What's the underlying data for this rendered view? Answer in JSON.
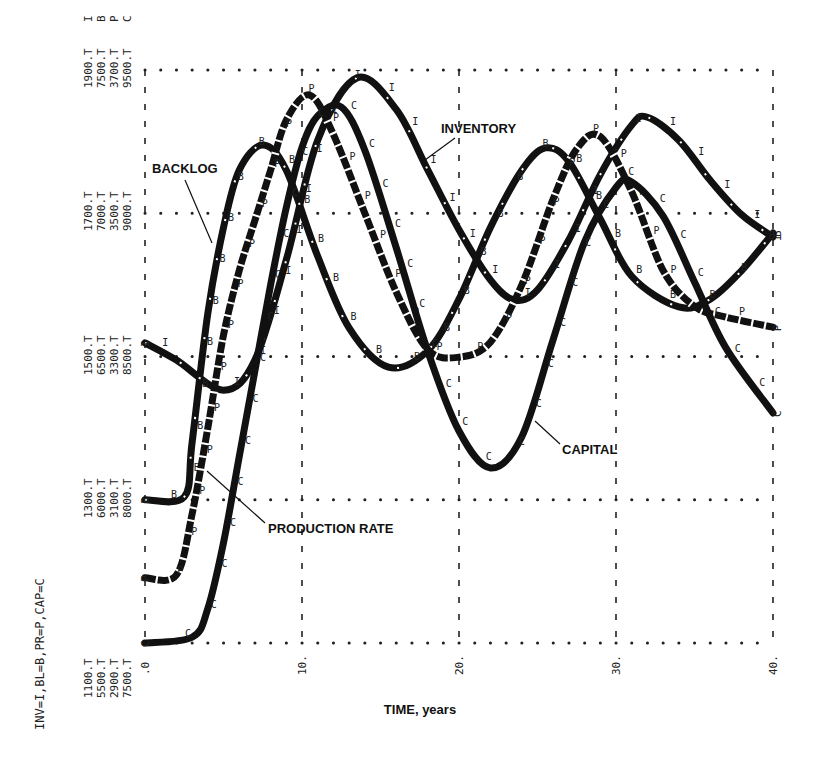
{
  "chart_data": {
    "type": "line",
    "title": "",
    "xlabel": "TIME, years",
    "ylabel": "INV=I,BL=B,PR=P,CAP=C",
    "xlim": [
      0,
      40
    ],
    "x_ticks": [
      ".0",
      "10.",
      "20.",
      "30.",
      "40."
    ],
    "x_tick_values": [
      0,
      10,
      20,
      30,
      40
    ],
    "grid": true,
    "legend_position": "inline annotations",
    "y_axes": [
      {
        "series": "I",
        "name": "INV",
        "ticks": [
          "1100.T",
          "1300.T",
          "1500.T",
          "1700.T",
          "1900.T"
        ],
        "range": [
          1100,
          1900
        ]
      },
      {
        "series": "B",
        "name": "BL",
        "ticks": [
          "5500.T",
          "6000.T",
          "6500.T",
          "7000.T",
          "7500.T"
        ],
        "range": [
          5500,
          7500
        ]
      },
      {
        "series": "P",
        "name": "PR",
        "ticks": [
          "2900.T",
          "3100.T",
          "3300.T",
          "3500.T",
          "3700.T"
        ],
        "range": [
          2900,
          3700
        ]
      },
      {
        "series": "C",
        "name": "CAP",
        "ticks": [
          "7500.T",
          "8000.T",
          "8500.T",
          "9000.T",
          "9500.T"
        ],
        "range": [
          7500,
          9500
        ]
      }
    ],
    "series": [
      {
        "name": "INVENTORY",
        "symbol": "I",
        "style": "solid-broken",
        "x": [
          0,
          2,
          5,
          7,
          9,
          11,
          13.5,
          16,
          18,
          20,
          22,
          23.5,
          25,
          27,
          29,
          31,
          32,
          34,
          36,
          38,
          40
        ],
        "values": [
          1519,
          1495,
          1453,
          1495,
          1635,
          1802,
          1889,
          1845,
          1761,
          1677,
          1607,
          1579,
          1593,
          1663,
          1754,
          1823,
          1834,
          1802,
          1746,
          1698,
          1667
        ]
      },
      {
        "name": "BACKLOG",
        "symbol": "B",
        "style": "solid-broken",
        "x": [
          0,
          2.5,
          3,
          4,
          5,
          6,
          7.5,
          9,
          11,
          13,
          15.5,
          18,
          20,
          22,
          24,
          25.5,
          27,
          29,
          31,
          34,
          36,
          38,
          40
        ],
        "values": [
          6000,
          6010,
          6200,
          6650,
          6950,
          7150,
          7238,
          7150,
          6850,
          6600,
          6463,
          6520,
          6700,
          6950,
          7150,
          7228,
          7180,
          6980,
          6780,
          6673,
          6700,
          6800,
          6931
        ]
      },
      {
        "name": "PRODUCTION RATE",
        "symbol": "P",
        "style": "dashed",
        "x": [
          0,
          2,
          3,
          4,
          5,
          6,
          7,
          8,
          9,
          10.5,
          12,
          14,
          16,
          18,
          20,
          22,
          24,
          26,
          27.5,
          29,
          31,
          33,
          35,
          37,
          40
        ],
        "values": [
          2991,
          2995,
          3080,
          3200,
          3330,
          3420,
          3490,
          3560,
          3630,
          3665,
          3610,
          3500,
          3390,
          3310,
          3299,
          3320,
          3400,
          3520,
          3590,
          3607,
          3530,
          3420,
          3370,
          3355,
          3341
        ]
      },
      {
        "name": "CAPITAL",
        "symbol": "C",
        "style": "solid",
        "x": [
          0,
          3,
          4,
          5,
          6,
          7,
          8,
          9,
          10,
          11,
          12.5,
          14,
          16,
          18,
          20,
          22,
          24,
          26,
          28,
          30,
          31,
          33,
          35,
          37,
          40
        ],
        "values": [
          7500,
          7520,
          7620,
          7850,
          8150,
          8450,
          8750,
          9020,
          9230,
          9340,
          9371,
          9220,
          8880,
          8520,
          8240,
          8111,
          8220,
          8560,
          8900,
          9090,
          9109,
          8990,
          8760,
          8530,
          8303
        ]
      }
    ],
    "annotations": [
      {
        "text": "BACKLOG",
        "points_to": "B",
        "x_approx": 5,
        "y_frac": 0.6
      },
      {
        "text": "INVENTORY",
        "points_to": "I",
        "x_approx": 18.5,
        "y_frac": 0.65
      },
      {
        "text": "PRODUCTION RATE",
        "points_to": "P",
        "x_approx": 4,
        "y_frac": 0.31
      },
      {
        "text": "CAPITAL",
        "points_to": "C",
        "x_approx": 25,
        "y_frac": 0.37
      }
    ]
  },
  "labels": {
    "axis_legend": "INV=I,BL=B,PR=P,CAP=C",
    "x_axis_title": "TIME, years",
    "backlog": "BACKLOG",
    "inventory": "INVENTORY",
    "production_rate": "PRODUCTION RATE",
    "capital": "CAPITAL",
    "top_series_key": [
      "I",
      "B",
      "P",
      "C"
    ]
  }
}
